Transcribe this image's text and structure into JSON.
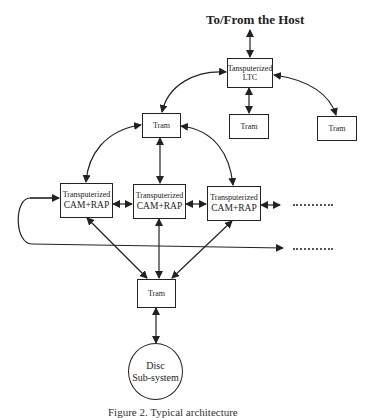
{
  "diagram": {
    "host_label": "To/From the Host",
    "ltc": {
      "line1": "Tansputerized",
      "line2": "LTC"
    },
    "trams": {
      "top": "Tram",
      "under_ltc": "Tram",
      "right": "Tram",
      "bottom": "Tram"
    },
    "cam_nodes": [
      {
        "line1": "Transputerized",
        "line2": "CAM+RAP"
      },
      {
        "line1": "Transputerized",
        "line2": "CAM+RAP"
      },
      {
        "line1": "Transputerized",
        "line2": "CAM+RAP"
      }
    ],
    "disc": {
      "line1": "Disc",
      "line2": "Sub-system"
    },
    "continuation_marks": [
      "row-continuation",
      "loop-continuation"
    ],
    "caption": "Figure 2. Typical architecture"
  }
}
